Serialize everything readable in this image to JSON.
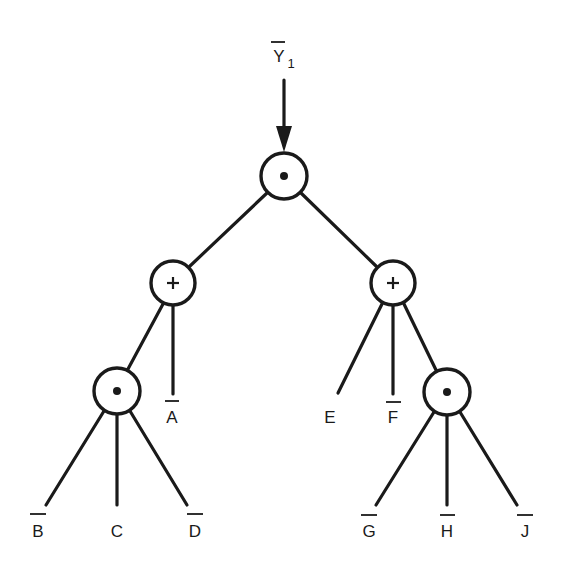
{
  "diagram": {
    "type": "logic expression tree",
    "output": {
      "label": "Y",
      "subscript": "1",
      "negated": true
    },
    "colors": {
      "stroke": "#1a1a1a",
      "background": "#ffffff"
    },
    "nodes": [
      {
        "id": "root",
        "op": "AND",
        "symbol": "•",
        "x": 284,
        "y": 176
      },
      {
        "id": "or_left",
        "op": "OR",
        "symbol": "+",
        "x": 173,
        "y": 283
      },
      {
        "id": "or_right",
        "op": "OR",
        "symbol": "+",
        "x": 393,
        "y": 283
      },
      {
        "id": "and_left",
        "op": "AND",
        "symbol": "•",
        "x": 117,
        "y": 391
      },
      {
        "id": "and_right",
        "op": "AND",
        "symbol": "•",
        "x": 447,
        "y": 392
      }
    ],
    "leaves": [
      {
        "label": "A",
        "negated": true
      },
      {
        "label": "B",
        "negated": true
      },
      {
        "label": "C",
        "negated": false
      },
      {
        "label": "D",
        "negated": true
      },
      {
        "label": "E",
        "negated": false
      },
      {
        "label": "F",
        "negated": true
      },
      {
        "label": "G",
        "negated": true
      },
      {
        "label": "H",
        "negated": true
      },
      {
        "label": "J",
        "negated": true
      }
    ],
    "edges": [
      [
        "root",
        "or_left"
      ],
      [
        "root",
        "or_right"
      ],
      [
        "or_left",
        "and_left"
      ],
      [
        "or_left",
        "A"
      ],
      [
        "and_left",
        "B"
      ],
      [
        "and_left",
        "C"
      ],
      [
        "and_left",
        "D"
      ],
      [
        "or_right",
        "E"
      ],
      [
        "or_right",
        "F"
      ],
      [
        "or_right",
        "and_right"
      ],
      [
        "and_right",
        "G"
      ],
      [
        "and_right",
        "H"
      ],
      [
        "and_right",
        "J"
      ]
    ]
  }
}
